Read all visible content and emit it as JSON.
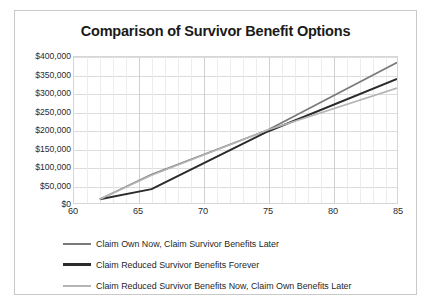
{
  "figure": {
    "border_color": "#c9c9c9",
    "background": "#ffffff"
  },
  "chart_data": {
    "type": "line",
    "title": "Comparison of Survivor Benefit Options",
    "xlabel": "",
    "ylabel": "",
    "xlim": [
      60,
      85
    ],
    "ylim": [
      0,
      400000
    ],
    "xticks": [
      60,
      65,
      70,
      75,
      80,
      85
    ],
    "xticklabels": [
      "60",
      "65",
      "70",
      "75",
      "80",
      "85"
    ],
    "yticks": [
      0,
      50000,
      100000,
      150000,
      200000,
      250000,
      300000,
      350000,
      400000
    ],
    "yticklabels": [
      "$0",
      "$50,000",
      "$100,000",
      "$150,000",
      "$200,000",
      "$250,000",
      "$300,000",
      "$350,000",
      "$400,000"
    ],
    "grid": true,
    "legend_position": "bottom-left",
    "series": [
      {
        "name": "Claim Own Now, Claim Survivor Benefits Later",
        "color": "#7a7a7a",
        "width": 1.7,
        "x": [
          62,
          66,
          75,
          85
        ],
        "values": [
          10000,
          78000,
          200000,
          385000
        ]
      },
      {
        "name": "Claim Reduced Survivor Benefits Forever",
        "color": "#2b2b2b",
        "width": 2.0,
        "x": [
          62,
          66,
          75,
          85
        ],
        "values": [
          10000,
          38000,
          196000,
          340000
        ]
      },
      {
        "name": "Claim Reduced Survivor Benefits Now, Claim Own Benefits Later",
        "color": "#b5b5b5",
        "width": 1.7,
        "x": [
          62,
          66,
          75,
          85
        ],
        "values": [
          10000,
          76000,
          200000,
          315000
        ]
      }
    ]
  },
  "legend": [
    {
      "label": "Claim Own Now, Claim Survivor Benefits Later",
      "color": "#7a7a7a",
      "thickness": 2
    },
    {
      "label": "Claim Reduced Survivor Benefits Forever",
      "color": "#2b2b2b",
      "thickness": 3
    },
    {
      "label": "Claim Reduced Survivor Benefits Now, Claim Own Benefits Later",
      "color": "#b5b5b5",
      "thickness": 2
    }
  ]
}
